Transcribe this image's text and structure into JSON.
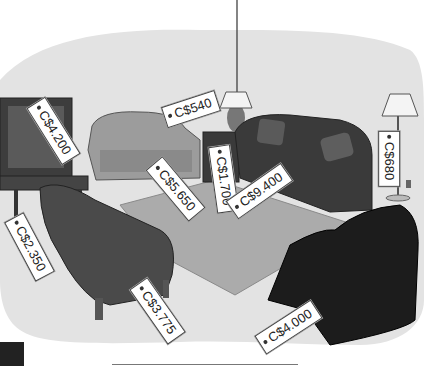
{
  "scene": {
    "description": "Illustrated living room furniture with price tags",
    "colors": {
      "floor": "#dcdcdc",
      "rug": "#a9a9a9",
      "dark_furniture": "#3a3a3a",
      "black_chair": "#1a1a1a",
      "light_sofa": "#9a9a9a"
    }
  },
  "tags": [
    {
      "item": "television",
      "label": "C$4.200"
    },
    {
      "item": "table-lamp",
      "label": "C$540"
    },
    {
      "item": "loveseat",
      "label": "C$5.650"
    },
    {
      "item": "side-table",
      "label": "C$1.700"
    },
    {
      "item": "sofa",
      "label": "C$9.400"
    },
    {
      "item": "floor-lamp",
      "label": "C$680"
    },
    {
      "item": "tv-stand",
      "label": "C$2.350"
    },
    {
      "item": "armchair",
      "label": "C$3.775"
    },
    {
      "item": "recliner",
      "label": "C$4.000"
    }
  ]
}
